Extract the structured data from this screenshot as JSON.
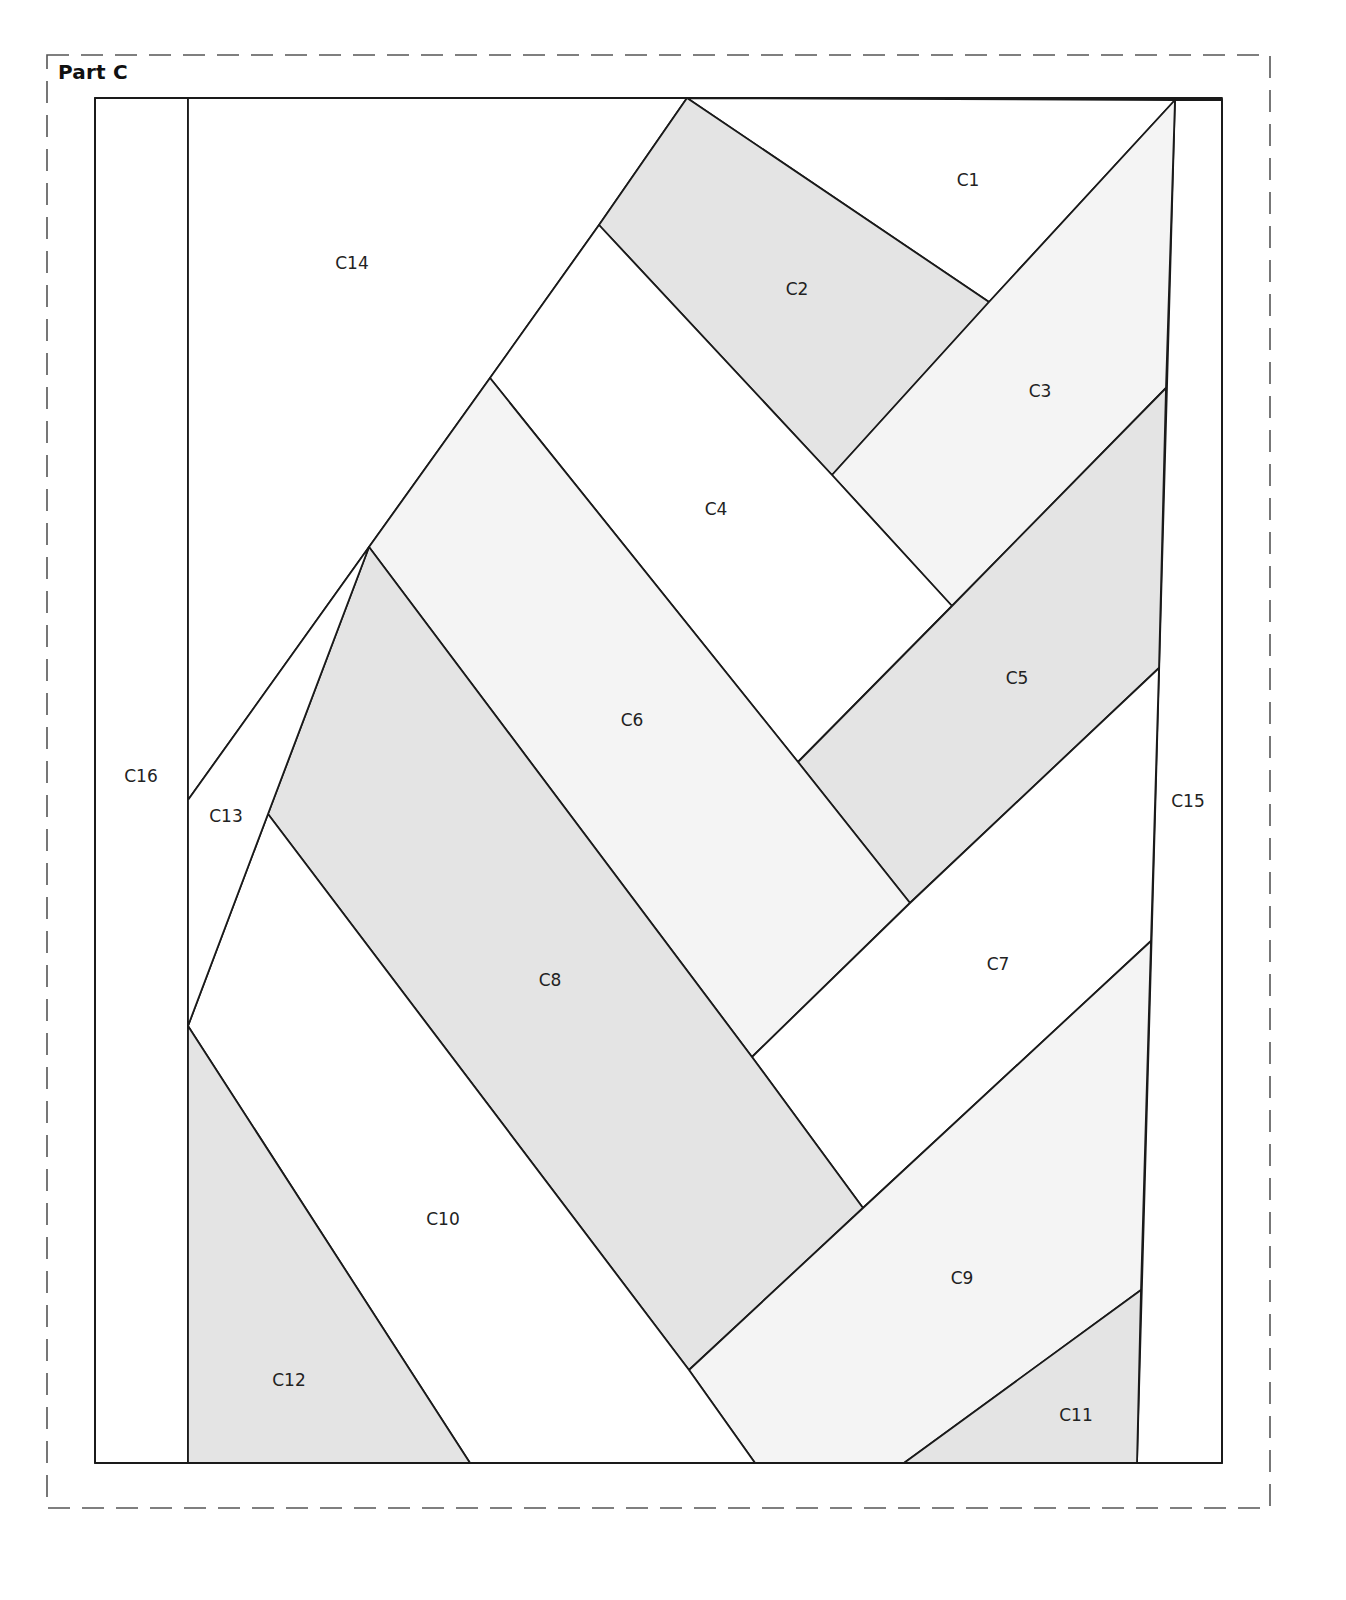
{
  "title": "Part C",
  "colors": {
    "line": "#1a1a1a",
    "shaded": "#e4e4e4",
    "light": "#f4f4f4",
    "white": "#ffffff",
    "dashed_border": "#555555"
  },
  "pieces": [
    {
      "id": "C1",
      "label": "C1",
      "fill": "white"
    },
    {
      "id": "C2",
      "label": "C2",
      "fill": "shaded"
    },
    {
      "id": "C3",
      "label": "C3",
      "fill": "light"
    },
    {
      "id": "C4",
      "label": "C4",
      "fill": "white"
    },
    {
      "id": "C5",
      "label": "C5",
      "fill": "shaded"
    },
    {
      "id": "C6",
      "label": "C6",
      "fill": "light"
    },
    {
      "id": "C7",
      "label": "C7",
      "fill": "white"
    },
    {
      "id": "C8",
      "label": "C8",
      "fill": "shaded"
    },
    {
      "id": "C9",
      "label": "C9",
      "fill": "light"
    },
    {
      "id": "C10",
      "label": "C10",
      "fill": "white"
    },
    {
      "id": "C11",
      "label": "C11",
      "fill": "shaded"
    },
    {
      "id": "C12",
      "label": "C12",
      "fill": "shaded"
    },
    {
      "id": "C13",
      "label": "C13",
      "fill": "white"
    },
    {
      "id": "C14",
      "label": "C14",
      "fill": "white"
    },
    {
      "id": "C15",
      "label": "C15",
      "fill": "white"
    },
    {
      "id": "C16",
      "label": "C16",
      "fill": "white"
    }
  ]
}
